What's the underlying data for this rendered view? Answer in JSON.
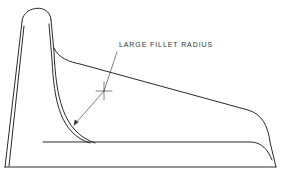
{
  "diagram": {
    "annotation": {
      "label": "LARGE FILLET RADIUS"
    },
    "colors": {
      "line": "#2a2a2a",
      "background": "#ffffff"
    }
  }
}
